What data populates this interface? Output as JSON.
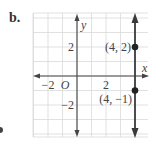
{
  "problem_label": "b.",
  "axes": {
    "x_label": "x",
    "y_label": "y",
    "origin_label": "O",
    "tick_labels": {
      "x": [
        {
          "value": -2,
          "text": "−2"
        },
        {
          "value": 2,
          "text": "2"
        }
      ],
      "y": [
        {
          "value": 2,
          "text": "2"
        },
        {
          "value": -2,
          "text": "−2"
        }
      ]
    },
    "x_range": [
      -3,
      5
    ],
    "y_range": [
      -4,
      4
    ]
  },
  "graph": {
    "line": {
      "type": "vertical",
      "equation": "x = 4",
      "x": 4
    },
    "points": [
      {
        "x": 4,
        "y": 2,
        "label": "(4, 2)"
      },
      {
        "x": 4,
        "y": -1,
        "label": "(4, −1)"
      }
    ]
  },
  "colors": {
    "grid": "#d9d9d9",
    "axis": "#444444",
    "line": "#3a3a3a",
    "text": "#444444"
  }
}
